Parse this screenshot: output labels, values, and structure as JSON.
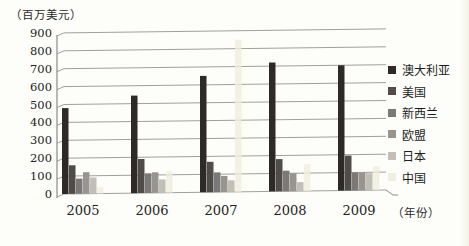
{
  "chart_data": {
    "type": "bar",
    "title": "",
    "unit_label": "（百万美元）",
    "xaxis_unit_label": "（年份）",
    "categories": [
      "2005",
      "2006",
      "2007",
      "2008",
      "2009"
    ],
    "series": [
      {
        "name": "澳大利亚",
        "color": "#2d2a28",
        "values": [
          480,
          545,
          650,
          720,
          700
        ]
      },
      {
        "name": "美国",
        "color": "#4f4c4a",
        "values": [
          160,
          190,
          170,
          180,
          195
        ]
      },
      {
        "name": "新西兰",
        "color": "#7b7977",
        "values": [
          85,
          110,
          110,
          115,
          100
        ]
      },
      {
        "name": "欧盟",
        "color": "#98958f",
        "values": [
          120,
          115,
          90,
          100,
          100
        ]
      },
      {
        "name": "日本",
        "color": "#c2bfb8",
        "values": [
          90,
          75,
          65,
          50,
          95
        ]
      },
      {
        "name": "中国",
        "color": "#f0eedd",
        "values": [
          35,
          120,
          850,
          150,
          135
        ]
      }
    ],
    "y_ticks": [
      0,
      100,
      200,
      300,
      400,
      500,
      600,
      700,
      800,
      900
    ],
    "ylim": [
      0,
      900
    ],
    "grid": true,
    "legend_position": "right",
    "style": {
      "gridline_color": "#a0a09c",
      "axis_color": "#8a8a86",
      "background": "#fdfdfa"
    }
  }
}
